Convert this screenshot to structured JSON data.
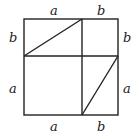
{
  "diagram": {
    "labels": {
      "top_left": "a",
      "top_right": "b",
      "left_top": "b",
      "left_bottom": "a",
      "right_top": "b",
      "right_bottom": "a",
      "bottom_left": "a",
      "bottom_right": "b"
    },
    "stroke_color": "#222222",
    "background": "#ffffff"
  }
}
